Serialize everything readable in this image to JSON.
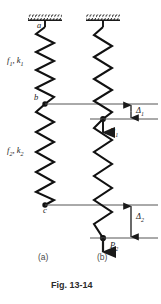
{
  "figure": {
    "caption": "Fig. 13-14",
    "subfigures": [
      {
        "key": "a",
        "label": "(a)",
        "x": 48,
        "y": 256
      },
      {
        "key": "b",
        "label": "(b)",
        "x": 107,
        "y": 256
      }
    ]
  },
  "colors": {
    "ink": "#1a1a1a",
    "spring": "#111111",
    "reference_line": "#555555",
    "hatch": "#1a1a1a",
    "background": "#ffffff",
    "label_gray": "#4a4a4a"
  },
  "labels": {
    "spring1_props": {
      "text": "f₁, k₁",
      "base": "f",
      "sub": "1",
      "second_base": "k",
      "second_sub": "1",
      "x": 8,
      "y": 60
    },
    "spring2_props": {
      "text": "f₂, k₂",
      "base": "f",
      "sub": "2",
      "second_base": "k",
      "second_sub": "2",
      "x": 8,
      "y": 150
    },
    "node_a": {
      "text": "a",
      "x": 36,
      "y": 28
    },
    "node_b": {
      "text": "b",
      "x": 32,
      "y": 95
    },
    "node_c": {
      "text": "c",
      "x": 42,
      "y": 210
    },
    "delta1": {
      "text": "Δ₁",
      "base": "Δ",
      "sub": "1",
      "x": 141,
      "y": 110
    },
    "delta2": {
      "text": "Δ₂",
      "base": "Δ",
      "sub": "2",
      "x": 141,
      "y": 214
    },
    "force_P1": {
      "text": "P₁",
      "base": "P",
      "sub": "1",
      "x": 113,
      "y": 131
    },
    "force_P2": {
      "text": "P₂",
      "base": "P",
      "sub": "2",
      "x": 113,
      "y": 244
    }
  },
  "geometry": {
    "column_a_center_x": 45,
    "column_b_center_x": 103,
    "support_top_y": 20,
    "spring1_start_y": 27,
    "node_b_y": 104,
    "node_c_y": 205,
    "amplitude": 9,
    "reference_lines": [
      {
        "name": "undeformed-b-level",
        "y": 104,
        "x1": 45,
        "x2": 158
      },
      {
        "name": "deformed-b-level",
        "y": 119,
        "x1": 90,
        "x2": 158
      },
      {
        "name": "undeformed-c-level",
        "y": 205,
        "x1": 45,
        "x2": 158
      },
      {
        "name": "deformed-c-level",
        "y": 238,
        "x1": 90,
        "x2": 158
      }
    ]
  },
  "annotations": {
    "delta1_dimension": {
      "y_top": 104,
      "y_bottom": 119,
      "x": 131
    },
    "delta2_dimension": {
      "y_top": 205,
      "y_bottom": 238,
      "x": 131
    },
    "P1_arrow": {
      "x": 103,
      "y_start": 119,
      "y_end": 136
    },
    "P2_arrow": {
      "x": 103,
      "y_start": 238,
      "y_end": 256
    }
  }
}
